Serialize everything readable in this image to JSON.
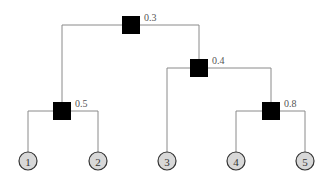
{
  "diagram": {
    "type": "tree",
    "colors": {
      "edge": "#8a8a8a",
      "inner_node": "#000000",
      "leaf_fill": "#d8d8d8",
      "leaf_stroke": "#333333",
      "label": "#555555"
    },
    "inner_nodes": [
      {
        "id": "n1",
        "label": "0.3",
        "x": 131,
        "y": 25
      },
      {
        "id": "n2",
        "label": "0.4",
        "x": 199,
        "y": 68
      },
      {
        "id": "n3",
        "label": "0.5",
        "x": 62,
        "y": 111
      },
      {
        "id": "n4",
        "label": "0.8",
        "x": 271,
        "y": 111
      }
    ],
    "leaves": [
      {
        "id": "l1",
        "label": "1",
        "x": 28,
        "y": 161
      },
      {
        "id": "l2",
        "label": "2",
        "x": 98,
        "y": 161
      },
      {
        "id": "l3",
        "label": "3",
        "x": 167,
        "y": 161
      },
      {
        "id": "l4",
        "label": "4",
        "x": 236,
        "y": 161
      },
      {
        "id": "l5",
        "label": "5",
        "x": 305,
        "y": 161
      }
    ],
    "edges": [
      {
        "from": "n1",
        "to": "n3"
      },
      {
        "from": "n1",
        "to": "n2"
      },
      {
        "from": "n3",
        "to": "l1"
      },
      {
        "from": "n3",
        "to": "l2"
      },
      {
        "from": "n2",
        "to": "l3"
      },
      {
        "from": "n2",
        "to": "n4"
      },
      {
        "from": "n4",
        "to": "l4"
      },
      {
        "from": "n4",
        "to": "l5"
      }
    ]
  }
}
